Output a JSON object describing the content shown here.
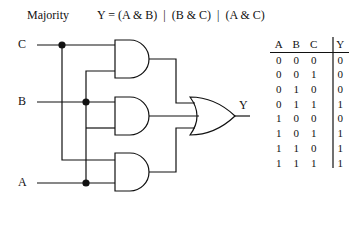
{
  "title": "Majority",
  "equation": "Y = (A & B)  |  (B & C)  |  (A & C)",
  "inputs": {
    "c": "C",
    "b": "B",
    "a": "A"
  },
  "output": "Y",
  "truth_table": {
    "headers": [
      "A",
      "B",
      "C",
      "Y"
    ],
    "rows": [
      [
        "0",
        "0",
        "0",
        "0"
      ],
      [
        "0",
        "0",
        "1",
        "0"
      ],
      [
        "0",
        "1",
        "0",
        "0"
      ],
      [
        "0",
        "1",
        "1",
        "1"
      ],
      [
        "1",
        "0",
        "0",
        "0"
      ],
      [
        "1",
        "0",
        "1",
        "1"
      ],
      [
        "1",
        "1",
        "0",
        "1"
      ],
      [
        "1",
        "1",
        "1",
        "1"
      ]
    ]
  }
}
